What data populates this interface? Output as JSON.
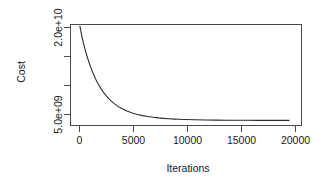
{
  "chart_data": {
    "type": "line",
    "title": "",
    "xlabel": "Iterations",
    "ylabel": "Cost",
    "xlim": [
      -900,
      21200
    ],
    "ylim": [
      3400000000,
      21500000000
    ],
    "grid": false,
    "legend": null,
    "xticks": [
      {
        "value": 0,
        "label": "0"
      },
      {
        "value": 5000,
        "label": "5000"
      },
      {
        "value": 10000,
        "label": "10000"
      },
      {
        "value": 15000,
        "label": "15000"
      },
      {
        "value": 20000,
        "label": "20000"
      }
    ],
    "yticks": [
      {
        "value": 20000000000,
        "label": "2.0e+10"
      },
      {
        "value": 15000000000,
        "label": ""
      },
      {
        "value": 10000000000,
        "label": ""
      },
      {
        "value": 5000000000,
        "label": "5.0e+09"
      }
    ],
    "series": [
      {
        "name": "cost",
        "color": "#2b2b2b",
        "x": [
          0,
          200,
          400,
          600,
          800,
          1000,
          1250,
          1500,
          1750,
          2000,
          2250,
          2500,
          2750,
          3000,
          3250,
          3500,
          3750,
          4000,
          4500,
          5000,
          5500,
          6000,
          6500,
          7000,
          7500,
          8000,
          8500,
          9000,
          9500,
          10000,
          11000,
          12000,
          13000,
          14000,
          15000,
          16000,
          17000,
          18000,
          19000,
          20000
        ],
        "y": [
          21200000000,
          19300000000,
          17700000000,
          16300000000,
          15100000000,
          14000000000,
          12800000000,
          11750000000,
          10850000000,
          10050000000,
          9350000000,
          8750000000,
          8220000000,
          7760000000,
          7360000000,
          7010000000,
          6700000000,
          6430000000,
          5990000000,
          5650000000,
          5380000000,
          5170000000,
          5000000000,
          4870000000,
          4760000000,
          4680000000,
          4610000000,
          4550000000,
          4510000000,
          4470000000,
          4420000000,
          4390000000,
          4370000000,
          4350000000,
          4340000000,
          4330000000,
          4325000000,
          4320000000,
          4318000000,
          4315000000
        ]
      }
    ]
  },
  "axes": {
    "box_color": "#4a4a4a",
    "tick_color": "#4a4a4a",
    "line_color": "#2b2b2b"
  }
}
